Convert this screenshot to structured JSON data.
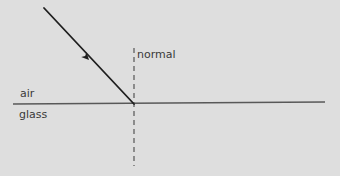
{
  "diagram": {
    "background_color": "#dedede",
    "labels": {
      "normal": "normal",
      "air": "air",
      "glass": "glass"
    },
    "elements": {
      "boundary_line": {
        "name": "air-glass boundary",
        "color": "#585858",
        "stroke_width": 1.6,
        "x1": 13,
        "y1": 104,
        "x2": 325,
        "y2": 102
      },
      "normal_line": {
        "name": "normal (dashed vertical)",
        "color": "#6a6a6a",
        "stroke_width": 1.4,
        "dash": "5,4",
        "x1": 134,
        "y1": 48,
        "x2": 134,
        "y2": 166
      },
      "incident_ray": {
        "name": "incident ray",
        "color": "#1e1e1e",
        "stroke_width": 1.8,
        "x1": 44,
        "y1": 8,
        "x2": 134,
        "y2": 104,
        "arrow_at_x": 89,
        "arrow_at_y": 60,
        "arrow_angle_deg": 133
      }
    }
  }
}
